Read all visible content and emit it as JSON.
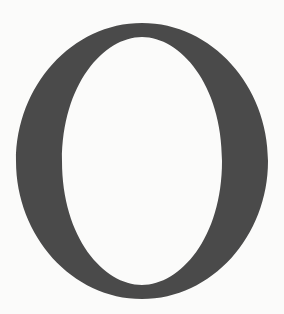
{
  "glyph": {
    "character": "O",
    "style": "serif capital letter",
    "fill_color": "#4a4a4a",
    "background_color": "#fbfbfa"
  }
}
